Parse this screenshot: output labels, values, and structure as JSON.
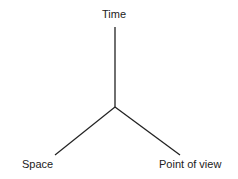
{
  "diagram": {
    "type": "three-axis",
    "center": {
      "x": 115,
      "y": 107
    },
    "axes": [
      {
        "id": "time",
        "label": "Time",
        "end": {
          "x": 115,
          "y": 27
        }
      },
      {
        "id": "space",
        "label": "Space",
        "end": {
          "x": 55,
          "y": 155
        }
      },
      {
        "id": "point_of_view",
        "label": "Point of view",
        "end": {
          "x": 180,
          "y": 155
        }
      }
    ],
    "line_color": "#222222"
  }
}
